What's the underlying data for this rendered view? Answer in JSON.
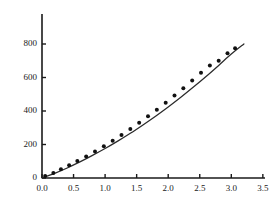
{
  "chart_data": {
    "type": "scatter",
    "title": "",
    "subtitle": "",
    "xlabel": "",
    "ylabel": "",
    "xlim": [
      0.0,
      3.5
    ],
    "ylim": [
      0,
      975
    ],
    "grid": false,
    "legend": null,
    "xticks": [
      0.0,
      0.5,
      1.0,
      1.5,
      2.0,
      2.5,
      3.0,
      3.5
    ],
    "xtick_labels": [
      "0.0",
      "0.5",
      "1.0",
      "1.5",
      "2.0",
      "2.5",
      "3.0",
      "3.5"
    ],
    "yticks": [
      0,
      200,
      400,
      600,
      800
    ],
    "ytick_labels": [
      "0",
      "200",
      "400",
      "600",
      "800"
    ],
    "axis_color": "#1a1a1a",
    "curve_color": "#2b2b2b",
    "marker_color": "#111111",
    "marker_size": 2.0,
    "series": [
      {
        "name": "data points",
        "type": "scatter",
        "marker": "dot",
        "x": [
          0.05,
          0.18,
          0.3,
          0.43,
          0.56,
          0.7,
          0.84,
          0.98,
          1.12,
          1.26,
          1.4,
          1.54,
          1.68,
          1.82,
          1.96,
          2.1,
          2.24,
          2.38,
          2.52,
          2.66,
          2.8,
          2.94,
          3.06
        ],
        "y": [
          12,
          30,
          52,
          76,
          101,
          128,
          158,
          190,
          222,
          256,
          292,
          330,
          368,
          408,
          450,
          492,
          536,
          582,
          628,
          672,
          700,
          745,
          775
        ]
      },
      {
        "name": "fitted curve",
        "type": "line",
        "x": [
          0.0,
          0.2,
          0.4,
          0.6,
          0.8,
          1.0,
          1.2,
          1.4,
          1.6,
          1.8,
          2.0,
          2.2,
          2.4,
          2.6,
          2.8,
          3.0,
          3.2
        ],
        "y": [
          0,
          28,
          60,
          96,
          135,
          176,
          220,
          267,
          317,
          369,
          424,
          482,
          543,
          606,
          672,
          740,
          800
        ]
      }
    ]
  },
  "geometry": {
    "origin_x": 42,
    "origin_y": 178,
    "x_per_unit": 63.1,
    "y_per_unit": 0.1675,
    "y_axis_top": 14,
    "x_axis_right": 265,
    "tick_len": 4
  }
}
